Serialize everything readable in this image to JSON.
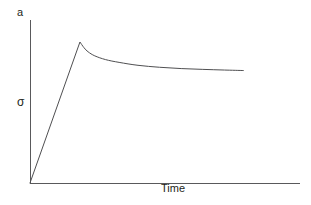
{
  "figure": {
    "panel_label": "a",
    "background_color": "#ffffff",
    "line_color": "#4f4f51",
    "axis_color": "#59595b",
    "text_color": "#231f20"
  },
  "chart_data": {
    "type": "line",
    "title": "",
    "subtitle": "",
    "panel_label": "a",
    "xlabel": "Time",
    "ylabel": "σ",
    "grid": false,
    "legend": null,
    "axes": {
      "x_axis_visible": true,
      "y_axis_visible": true,
      "x_ticks": [],
      "y_ticks": [],
      "xlim": [
        0,
        1
      ],
      "ylim": [
        0,
        1
      ],
      "x_axis_pixel_span": [
        30,
        300
      ],
      "y_axis_pixel_span": [
        20,
        183
      ],
      "origin_pixel": [
        30,
        183
      ]
    },
    "annotations": [],
    "series": [
      {
        "name": "stress relaxation",
        "description": "linear elastic loading to a yield peak followed by monotonic decay to a steady-state plateau",
        "x": [
          0.0,
          0.05,
          0.1,
          0.15,
          0.185,
          0.2,
          0.215,
          0.24,
          0.28,
          0.33,
          0.4,
          0.48,
          0.56,
          0.64,
          0.72,
          0.79
        ],
        "y": [
          0.0,
          0.235,
          0.47,
          0.705,
          0.865,
          0.83,
          0.805,
          0.78,
          0.757,
          0.74,
          0.722,
          0.71,
          0.702,
          0.697,
          0.693,
          0.69
        ],
        "peak": {
          "x": 0.185,
          "y": 0.865
        },
        "plateau_y": 0.69
      }
    ]
  }
}
